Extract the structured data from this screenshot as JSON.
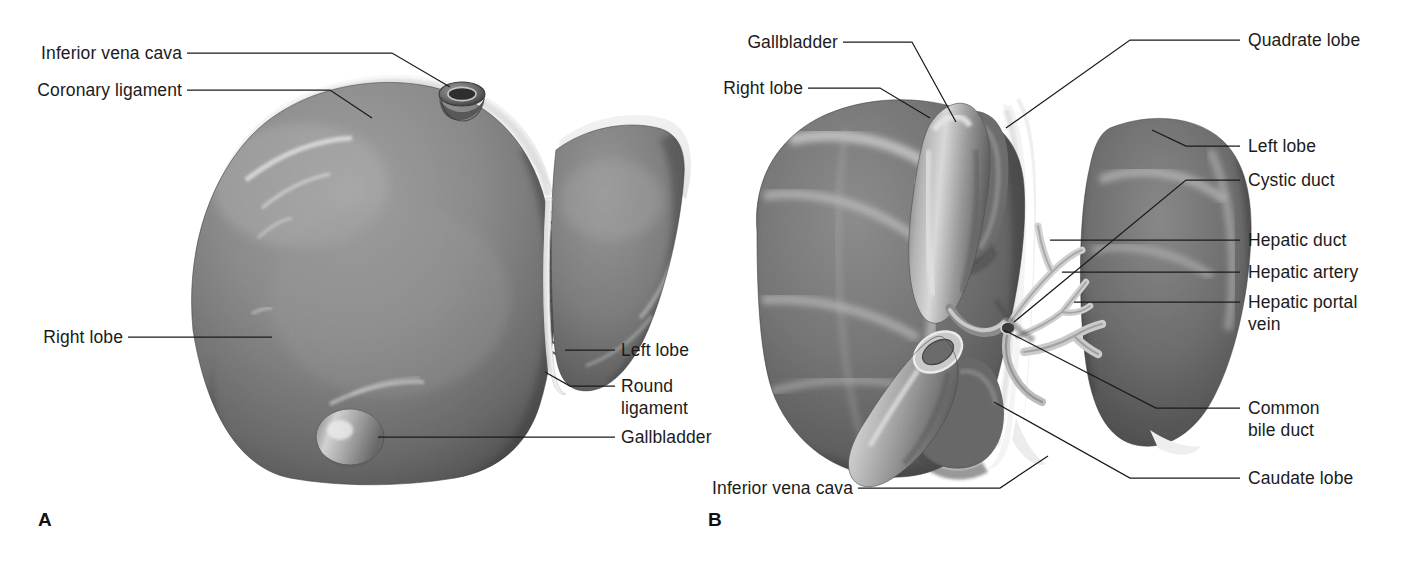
{
  "figure": {
    "background": "#ffffff",
    "text_color": "#1b1b1b",
    "leader_color": "#1a1a1a",
    "tissue_colors": {
      "liver_mid": "#8a8a8a",
      "liver_dark": "#4f4f4f",
      "liver_deep": "#3c3c3c",
      "highlight": "#d6d6d6",
      "ligament_white": "#f2f2f2",
      "vessel_light": "#e3e3e3",
      "gallbladder": "#9d9d9d"
    }
  },
  "panels": [
    {
      "id": "panel-a",
      "marker": "A",
      "caption": "Anterior view"
    },
    {
      "id": "panel-b",
      "marker": "B",
      "caption": "Visceral (posteroinferior) view"
    }
  ],
  "panel_a": {
    "marker": "A",
    "labels": [
      {
        "key": "inferior_vena_cava",
        "text": "Inferior vena cava",
        "align": "right"
      },
      {
        "key": "coronary_ligament",
        "text": "Coronary ligament",
        "align": "right"
      },
      {
        "key": "right_lobe",
        "text": "Right lobe",
        "align": "right"
      },
      {
        "key": "left_lobe",
        "text": "Left lobe",
        "align": "left"
      },
      {
        "key": "round_ligament",
        "text": "Round\nligament",
        "align": "left"
      },
      {
        "key": "gallbladder",
        "text": "Gallbladder",
        "align": "left"
      }
    ]
  },
  "panel_b": {
    "marker": "B",
    "labels": [
      {
        "key": "gallbladder",
        "text": "Gallbladder",
        "align": "right"
      },
      {
        "key": "right_lobe",
        "text": "Right lobe",
        "align": "right"
      },
      {
        "key": "inferior_vena_cava",
        "text": "Inferior vena cava",
        "align": "right"
      },
      {
        "key": "quadrate_lobe",
        "text": "Quadrate lobe",
        "align": "left"
      },
      {
        "key": "left_lobe",
        "text": "Left lobe",
        "align": "left"
      },
      {
        "key": "cystic_duct",
        "text": "Cystic duct",
        "align": "left"
      },
      {
        "key": "hepatic_duct",
        "text": "Hepatic duct",
        "align": "left"
      },
      {
        "key": "hepatic_artery",
        "text": "Hepatic artery",
        "align": "left"
      },
      {
        "key": "hepatic_portal_vein",
        "text": "Hepatic portal\nvein",
        "align": "left"
      },
      {
        "key": "common_bile_duct",
        "text": "Common\nbile duct",
        "align": "left"
      },
      {
        "key": "caudate_lobe",
        "text": "Caudate lobe",
        "align": "left"
      }
    ]
  }
}
